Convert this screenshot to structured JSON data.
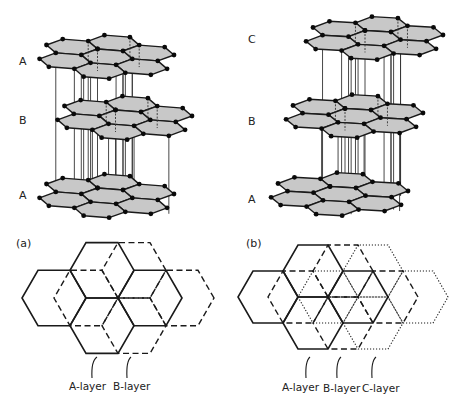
{
  "figure_a": {
    "panel_label": "(a)",
    "layer_labels": [
      {
        "text": "A",
        "x": 19,
        "y": 56
      },
      {
        "text": "B",
        "x": 19,
        "y": 115
      },
      {
        "text": "A",
        "x": 19,
        "y": 190
      }
    ],
    "lattice": {
      "ex": [
        25.5,
        2.0
      ],
      "ey": [
        -4.0,
        8.0
      ],
      "layers": [
        {
          "name": "A",
          "origin": [
            72,
            186
          ],
          "position": "bottom"
        },
        {
          "name": "B",
          "origin": [
            90,
            108
          ],
          "position": "middle"
        },
        {
          "name": "A",
          "origin": [
            72,
            47
          ],
          "position": "top"
        }
      ]
    },
    "plan": {
      "side": 32,
      "layers": [
        {
          "name": "A-layer",
          "style": "solid",
          "shift": 0
        },
        {
          "name": "B-layer",
          "style": "dashed",
          "shift": 32
        }
      ],
      "base_center": [
        54,
        298
      ],
      "callouts": [
        {
          "text": "A-layer",
          "x": 69,
          "y": 381,
          "from": [
            97,
            357
          ],
          "to": [
            92,
            378
          ]
        },
        {
          "text": "B-layer",
          "x": 113,
          "y": 381,
          "from": [
            131,
            357
          ],
          "to": [
            127,
            378
          ]
        }
      ]
    }
  },
  "figure_b": {
    "panel_label": "(b)",
    "layer_labels": [
      {
        "text": "C",
        "x": 248,
        "y": 34
      },
      {
        "text": "B",
        "x": 248,
        "y": 116
      },
      {
        "text": "A",
        "x": 248,
        "y": 194
      }
    ],
    "lattice": {
      "ex": [
        26.0,
        1.5
      ],
      "ey": [
        -4.0,
        8.0
      ],
      "layers": [
        {
          "name": "A",
          "origin": [
            304,
            185
          ],
          "position": "bottom"
        },
        {
          "name": "B",
          "origin": [
            319,
            107
          ],
          "position": "middle"
        },
        {
          "name": "C",
          "origin": [
            339,
            29
          ],
          "position": "top"
        }
      ]
    },
    "plan": {
      "side": 30,
      "layers": [
        {
          "name": "A-layer",
          "style": "solid",
          "shift": 0
        },
        {
          "name": "B-layer",
          "style": "dashed",
          "shift": 30
        },
        {
          "name": "C-layer",
          "style": "dotted",
          "shift": 60
        }
      ],
      "base_center": [
        268,
        297
      ],
      "callouts": [
        {
          "text": "A-layer",
          "x": 282,
          "y": 382,
          "from": [
            310,
            357
          ],
          "to": [
            306,
            378
          ]
        },
        {
          "text": "B-layer",
          "x": 323,
          "y": 383,
          "from": [
            341,
            357
          ],
          "to": [
            337,
            378
          ]
        },
        {
          "text": "C-layer",
          "x": 362,
          "y": 383,
          "from": [
            376,
            357
          ],
          "to": [
            372,
            378
          ]
        }
      ]
    }
  },
  "hex_patch_centers": [
    [
      0,
      0
    ],
    [
      1.5,
      -0.866
    ],
    [
      1.5,
      0.866
    ],
    [
      3,
      0
    ],
    [
      0,
      1.732
    ],
    [
      1.5,
      2.598
    ],
    [
      3,
      1.732
    ]
  ],
  "plan_patch_centers": [
    [
      0,
      0
    ],
    [
      1.5,
      -0.866
    ],
    [
      1.5,
      0.866
    ],
    [
      3,
      0
    ]
  ],
  "colors": {
    "hex_fill": "#c8c8c8",
    "line": "#1a1a1a",
    "atom": "#0a0a0a",
    "text": "#222222"
  }
}
